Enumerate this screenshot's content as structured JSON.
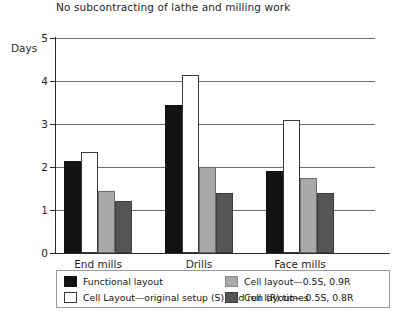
{
  "chart_data": {
    "type": "bar",
    "title": "No subcontracting of lathe and milling work",
    "xlabel": "",
    "ylabel": "Days",
    "ylim": [
      0,
      5
    ],
    "yticks": [
      0,
      1,
      2,
      3,
      4,
      5
    ],
    "grid": true,
    "legend_position": "bottom",
    "categories": [
      "End mills",
      "Drills",
      "Face mills"
    ],
    "series": [
      {
        "name": "Functional layout",
        "color": "#121212",
        "values": [
          2.15,
          3.45,
          1.9
        ]
      },
      {
        "name": "Cell Layout—original setup (S) and run (R) times",
        "color": "#ffffff",
        "values": [
          2.35,
          4.15,
          3.1
        ]
      },
      {
        "name": "Cell layout—0.5S, 0.9R",
        "color": "#a9a9a9",
        "values": [
          1.45,
          2.0,
          1.75
        ]
      },
      {
        "name": "Cell layout— 0.5S, 0.8R",
        "color": "#555555",
        "values": [
          1.2,
          1.4,
          1.4
        ]
      }
    ]
  },
  "axis": {
    "y_title": "Days",
    "tick_labels": [
      "5",
      "4",
      "3",
      "2",
      "1",
      "0"
    ]
  },
  "legend": {
    "items": [
      {
        "label": "Functional layout"
      },
      {
        "label": "Cell Layout—original setup (S) and run (R) times"
      },
      {
        "label": "Cell layout—0.5S, 0.9R"
      },
      {
        "label": "Cell layout— 0.5S, 0.8R"
      }
    ]
  }
}
